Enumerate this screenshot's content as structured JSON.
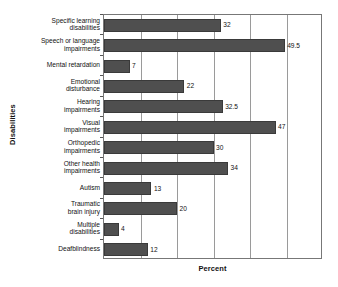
{
  "chart_data": {
    "type": "bar",
    "orientation": "horizontal",
    "title": "",
    "xlabel": "Percent",
    "ylabel": "Disabilities",
    "categories": [
      "Specific learning disabilities",
      "Speech or language impairments",
      "Mental retardation",
      "Emotional disturbance",
      "Hearing impairments",
      "Visual impairments",
      "Orthopedic impairments",
      "Other health impairments",
      "Autism",
      "Traumatic brain injury",
      "Multiple disabilities",
      "Deafblindness"
    ],
    "category_lines": [
      [
        "Specific learning",
        "disabilities"
      ],
      [
        "Speech or language",
        "impairments"
      ],
      [
        "Mental retardation"
      ],
      [
        "Emotional",
        "disturbance"
      ],
      [
        "Hearing",
        "impairments"
      ],
      [
        "Visual",
        "impairments"
      ],
      [
        "Orthopedic",
        "impairments"
      ],
      [
        "Other health",
        "impairments"
      ],
      [
        "Autism"
      ],
      [
        "Traumatic",
        "brain injury"
      ],
      [
        "Multiple",
        "disabilities"
      ],
      [
        "Deafblindness"
      ]
    ],
    "values": [
      32,
      49.5,
      7,
      22,
      32.5,
      47,
      30,
      34,
      13,
      20,
      4,
      12
    ],
    "value_labels": [
      "32",
      "49.5",
      "7",
      "22",
      "32.5",
      "47",
      "30",
      "34",
      "13",
      "20",
      "4",
      "12"
    ],
    "xlim": [
      0,
      60
    ],
    "gridline_values": [
      10,
      20,
      30,
      40,
      50
    ],
    "grid": true,
    "legend": false,
    "bar_color": "#4f4f4f",
    "grid_color": "#9a9a9a",
    "axis_color": "#777777"
  }
}
